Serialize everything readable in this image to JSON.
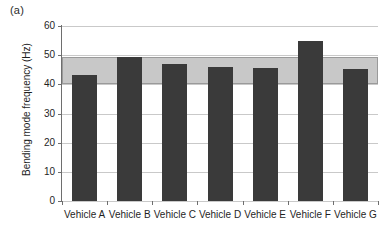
{
  "panel": {
    "letter": "(a)"
  },
  "chart_data": {
    "type": "bar",
    "title": "",
    "subtitle": "",
    "xlabel": "",
    "ylabel": "Bending mode frequency (Hz)",
    "categories": [
      "Vehicle A",
      "Vehicle B",
      "Vehicle C",
      "Vehicle D",
      "Vehicle E",
      "Vehicle F",
      "Vehicle G"
    ],
    "values": [
      43.2,
      49.3,
      47.0,
      46.0,
      45.5,
      54.8,
      45.2
    ],
    "ylim": [
      0,
      60
    ],
    "yticks": [
      0,
      10,
      20,
      30,
      40,
      50,
      60
    ],
    "ytick_labels": [
      "0",
      "10",
      "20",
      "30",
      "40",
      "50",
      "60"
    ],
    "grid": true,
    "legend": false,
    "legend_position": "none",
    "bar_color": "#3a3a3a",
    "annotations": [
      {
        "name": "target-band",
        "type": "hband",
        "y_min": 40.0,
        "y_max": 49.3,
        "color": "#c8c8c8",
        "edge_color": "#9a9a9a"
      }
    ]
  },
  "colors": {
    "axis": "#6e6e6e",
    "gridline": "#c9c9c9",
    "bar": "#3a3a3a",
    "band_fill": "#c8c8c8",
    "band_edge": "#9a9a9a",
    "text": "#1f1f1f",
    "background": "#ffffff"
  }
}
